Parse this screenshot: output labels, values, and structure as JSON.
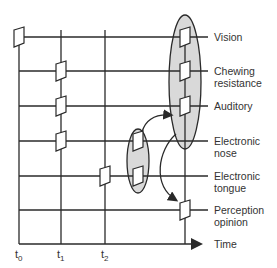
{
  "diagram": {
    "type": "sensory-fusion-timeline",
    "time_axis_label": "Time",
    "time_ticks": [
      {
        "base": "t",
        "sub": "0"
      },
      {
        "base": "t",
        "sub": "1"
      },
      {
        "base": "t",
        "sub": "2"
      }
    ],
    "rows": [
      {
        "label_line1": "Vision",
        "label_line2": ""
      },
      {
        "label_line1": "Chewing",
        "label_line2": "resistance"
      },
      {
        "label_line1": "Auditory",
        "label_line2": ""
      },
      {
        "label_line1": "Electronic",
        "label_line2": "nose"
      },
      {
        "label_line1": "Electronic",
        "label_line2": "tongue"
      },
      {
        "label_line1": "Perception",
        "label_line2": "opinion"
      }
    ],
    "groups": [
      {
        "name": "human-senses-group",
        "members": [
          "Vision",
          "Chewing resistance",
          "Auditory"
        ]
      },
      {
        "name": "electronic-sensors-group",
        "members": [
          "Electronic nose",
          "Electronic tongue"
        ]
      }
    ],
    "colors": {
      "line": "#2a2a2a",
      "ellipse_fill": "#d9d9d9",
      "node_fill": "#ffffff"
    }
  }
}
